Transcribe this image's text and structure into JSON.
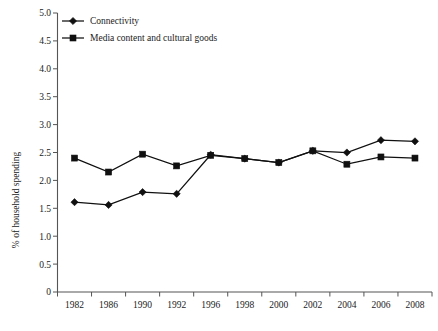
{
  "chart_data": {
    "type": "line",
    "title": "",
    "xlabel": "",
    "ylabel": "% of household spending",
    "categories": [
      "1982",
      "1986",
      "1990",
      "1992",
      "1996",
      "1998",
      "2000",
      "2002",
      "2004",
      "2006",
      "2008"
    ],
    "ylim": [
      0,
      5.0
    ],
    "ytick_labels": [
      "0",
      "0.5",
      "1.0",
      "1.5",
      "2.0",
      "2.5",
      "3.0",
      "3.5",
      "4.0",
      "4.5",
      "5.0"
    ],
    "ytick_values": [
      0,
      0.5,
      1.0,
      1.5,
      2.0,
      2.5,
      3.0,
      3.5,
      4.0,
      4.5,
      5.0
    ],
    "grid": false,
    "legend_position": "top-left",
    "series": [
      {
        "name": "Connectivity",
        "marker": "diamond",
        "color": "#101010",
        "values": [
          1.61,
          1.56,
          1.79,
          1.76,
          2.46,
          2.39,
          2.32,
          2.53,
          2.5,
          2.72,
          2.7
        ]
      },
      {
        "name": "Media content and cultural goods",
        "marker": "square",
        "color": "#101010",
        "values": [
          2.4,
          2.15,
          2.47,
          2.26,
          2.45,
          2.39,
          2.32,
          2.53,
          2.29,
          2.42,
          2.4
        ]
      }
    ]
  },
  "legend": {
    "items": [
      {
        "label": "Connectivity"
      },
      {
        "label": "Media content and cultural goods"
      }
    ]
  },
  "caption": {
    "text": ""
  }
}
